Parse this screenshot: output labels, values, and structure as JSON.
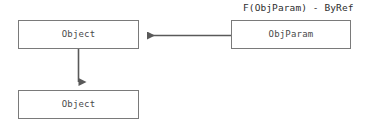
{
  "diagram": {
    "title_caption": "F(ObjParam) - ByRef",
    "background_color": "#ffffff",
    "box_border_color": "#7a7a7a",
    "arrow_color": "#595959",
    "label_color": "#4a4a4a",
    "caption_color": "#2e2e2e",
    "nodes": [
      {
        "id": "object-top-left",
        "label": "Object"
      },
      {
        "id": "object-bottom-left",
        "label": "Object"
      },
      {
        "id": "objparam-right",
        "label": "ObjParam"
      }
    ],
    "edges": [
      {
        "id": "objparam-to-object",
        "from": "objparam-right",
        "to": "object-top-left",
        "direction": "left",
        "style": "solid-arrow"
      },
      {
        "id": "object-to-object",
        "from": "object-top-left",
        "to": "object-bottom-left",
        "direction": "down",
        "style": "solid-arrow"
      }
    ]
  }
}
